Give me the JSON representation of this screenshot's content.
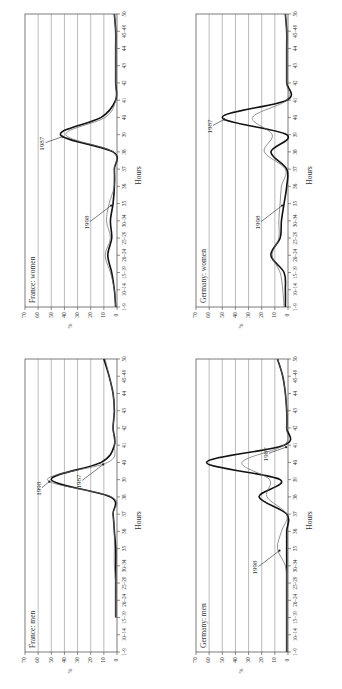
{
  "page": {
    "page_number": ""
  },
  "chart_data": [
    {
      "id": "france-women",
      "type": "line",
      "title": "France: women",
      "xlabel": "Hours",
      "ylabel": "%",
      "ylim": [
        0,
        70
      ],
      "yticks": [
        0,
        10,
        20,
        30,
        40,
        50,
        60,
        70
      ],
      "grid": true,
      "categories": [
        "1–9",
        "10–14",
        "15–19",
        "20–24",
        "25–29",
        "30–34",
        "35",
        "36",
        "37",
        "38",
        "39",
        "40",
        "41",
        "42",
        "43",
        "44",
        "45–49",
        "50"
      ],
      "series": [
        {
          "name": "1987",
          "style": "thick",
          "values": [
            1,
            2,
            4,
            7,
            4,
            5,
            3,
            2,
            2,
            3,
            43,
            12,
            1,
            1,
            1,
            1,
            1,
            2
          ]
        },
        {
          "name": "1998",
          "style": "thin",
          "values": [
            1,
            2,
            5,
            9,
            5,
            8,
            6,
            2,
            2,
            3,
            39,
            9,
            1,
            1,
            1,
            1,
            1,
            2
          ]
        }
      ],
      "annotations": [
        {
          "text": "1987",
          "target": "39"
        },
        {
          "text": "1998",
          "target": "35"
        }
      ]
    },
    {
      "id": "germany-women",
      "type": "line",
      "title": "Germany: women",
      "xlabel": "Hours",
      "ylabel": "%",
      "ylim": [
        0,
        70
      ],
      "yticks": [
        0,
        10,
        20,
        30,
        40,
        50,
        60,
        70
      ],
      "grid": true,
      "categories": [
        "1–9",
        "10–14",
        "15–19",
        "20–24",
        "25–29",
        "30–34",
        "35",
        "36",
        "37",
        "38",
        "39",
        "40",
        "41",
        "42",
        "43",
        "44",
        "45–49",
        "50"
      ],
      "series": [
        {
          "name": "1987",
          "style": "thick",
          "values": [
            2,
            2,
            3,
            13,
            6,
            5,
            3,
            1,
            1,
            13,
            1,
            50,
            1,
            1,
            1,
            1,
            1,
            2
          ]
        },
        {
          "name": "1998",
          "style": "thin",
          "values": [
            3,
            4,
            6,
            12,
            7,
            7,
            6,
            5,
            2,
            18,
            12,
            27,
            1,
            1,
            1,
            1,
            1,
            2
          ]
        }
      ],
      "annotations": [
        {
          "text": "1987",
          "target": "40"
        },
        {
          "text": "1998",
          "target": "35"
        }
      ]
    },
    {
      "id": "france-men",
      "type": "line",
      "title": "France: men",
      "xlabel": "Hours",
      "ylabel": "%",
      "ylim": [
        0,
        70
      ],
      "yticks": [
        0,
        10,
        20,
        30,
        40,
        50,
        60,
        70
      ],
      "grid": true,
      "categories": [
        "1–9",
        "10–14",
        "15–19",
        "20–24",
        "25–29",
        "30–34",
        "35",
        "36",
        "37",
        "38",
        "39",
        "40",
        "41",
        "42",
        "43",
        "44",
        "45–49",
        "50"
      ],
      "series": [
        {
          "name": "1987",
          "style": "thick",
          "values": [
            null,
            null,
            1,
            1,
            1,
            1,
            1,
            2,
            3,
            5,
            50,
            12,
            2,
            3,
            2,
            3,
            6,
            10
          ]
        },
        {
          "name": "1998",
          "style": "thin",
          "values": [
            null,
            null,
            1,
            1,
            1,
            2,
            2,
            2,
            3,
            4,
            53,
            7,
            2,
            3,
            2,
            3,
            6,
            9
          ]
        }
      ],
      "annotations": [
        {
          "text": "1998",
          "target": "39"
        },
        {
          "text": "1987",
          "target": "40"
        }
      ]
    },
    {
      "id": "germany-men",
      "type": "line",
      "title": "Germany: men",
      "xlabel": "Hours",
      "ylabel": "%",
      "ylim": [
        0,
        70
      ],
      "yticks": [
        0,
        10,
        20,
        30,
        40,
        50,
        60,
        70
      ],
      "grid": true,
      "categories": [
        "1–9",
        "10–14",
        "15–19",
        "20–24",
        "25–29",
        "30–34",
        "35",
        "36",
        "37",
        "38",
        "39",
        "40",
        "41",
        "42",
        "43",
        "44",
        "45–49",
        "50"
      ],
      "series": [
        {
          "name": "1987",
          "style": "thick",
          "values": [
            1,
            1,
            1,
            1,
            1,
            1,
            1,
            1,
            1,
            22,
            6,
            62,
            3,
            1,
            1,
            2,
            4,
            8
          ]
        },
        {
          "name": "1998",
          "style": "thin",
          "values": [
            1,
            1,
            1,
            1,
            1,
            2,
            8,
            5,
            1,
            16,
            14,
            35,
            3,
            1,
            1,
            2,
            4,
            8
          ]
        }
      ],
      "annotations": [
        {
          "text": "1987",
          "target": "41"
        },
        {
          "text": "1998",
          "target": "35"
        }
      ]
    }
  ]
}
